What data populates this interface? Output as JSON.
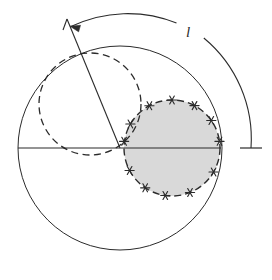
{
  "figure": {
    "background_color": "#ffffff",
    "stroke_color": "#2b2b2b",
    "shaded_fill_color": "#d9d9d9",
    "labels": {
      "arc_length": "l"
    },
    "elements": {
      "outer_circle": {
        "name": "outer-circle",
        "cx": 120,
        "cy": 148,
        "r": 102,
        "style": "solid",
        "fill": "none"
      },
      "dashed_circle": {
        "name": "dashed-circle",
        "cx": 90,
        "cy": 104,
        "r": 51,
        "style": "dashed",
        "fill": "none"
      },
      "shaded_circle": {
        "name": "shaded-circle",
        "cx": 172,
        "cy": 148,
        "r": 48,
        "style": "dashed",
        "fill": "#d9d9d9"
      },
      "horizontal_diameter": {
        "name": "horizontal-diameter",
        "x1": 18,
        "y1": 148,
        "x2": 221,
        "y2": 148
      },
      "radius_line": {
        "name": "radius-line",
        "x1": 120,
        "y1": 148,
        "x2": 67,
        "y2": 19
      },
      "arc_measure": {
        "name": "arc-measure",
        "cx": 120,
        "cy": 148,
        "r": 131,
        "start_angle_deg": 112,
        "end_angle_deg": 0,
        "arrow_at": "start",
        "tick_at": "end"
      }
    },
    "markers": {
      "name": "boundary-asterisks",
      "glyph": "asterisk",
      "count": 12,
      "angles_deg": [
        8,
        35,
        62,
        90,
        118,
        150,
        182,
        208,
        236,
        262,
        292,
        330
      ]
    }
  }
}
